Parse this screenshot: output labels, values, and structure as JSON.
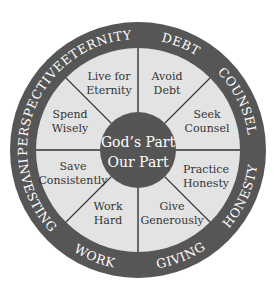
{
  "diagram": {
    "colors": {
      "ring": "#565656",
      "sector": "#e3e3e3",
      "hub": "#555555",
      "divider": "#333333",
      "ring_text": "#ffffff",
      "sector_text": "#333333"
    },
    "hub": {
      "line1": "God’s Part",
      "line2": "Our Part"
    },
    "ring_labels": [
      {
        "text": "PERSPECTIVE",
        "angle": -157
      },
      {
        "text": "ETERNITY",
        "angle": -112
      },
      {
        "text": "DEBT",
        "angle": -68
      },
      {
        "text": "COUNSEL",
        "angle": -26
      },
      {
        "text": "HONESTY",
        "angle": 24
      },
      {
        "text": "GIVING",
        "angle": 68
      },
      {
        "text": "WORK",
        "angle": 112
      },
      {
        "text": "INVESTING",
        "angle": 156
      }
    ],
    "sectors": [
      {
        "line1": "Live for",
        "line2": "Eternity",
        "x": 109,
        "y": 80
      },
      {
        "line1": "Avoid",
        "line2": "Debt",
        "x": 167,
        "y": 80
      },
      {
        "line1": "Seek",
        "line2": "Counsel",
        "x": 207,
        "y": 118
      },
      {
        "line1": "Practice",
        "line2": "Honesty",
        "x": 206,
        "y": 173
      },
      {
        "line1": "Give",
        "line2": "Generously",
        "x": 172,
        "y": 210
      },
      {
        "line1": "Work",
        "line2": "Hard",
        "x": 108,
        "y": 210
      },
      {
        "line1": "Save",
        "line2": "Consistently",
        "x": 73,
        "y": 170
      },
      {
        "line1": "Spend",
        "line2": "Wisely",
        "x": 70,
        "y": 118
      }
    ]
  }
}
